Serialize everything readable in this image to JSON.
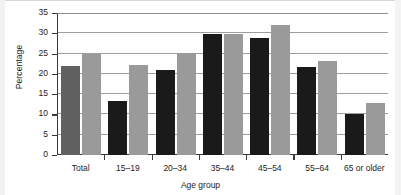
{
  "chart_data": {
    "type": "bar",
    "title": "",
    "xlabel": "Age group",
    "ylabel": "Percentage",
    "categories": [
      "Total",
      "15–19",
      "20–34",
      "35–44",
      "45–54",
      "55–64",
      "65 or older"
    ],
    "series": [
      {
        "name": "series-a",
        "color": "#1a1a1a",
        "values": [
          21.9,
          13.4,
          20.9,
          29.8,
          28.8,
          21.6,
          10.1
        ]
      },
      {
        "name": "series-b",
        "color": "#9a9a9a",
        "values": [
          25.0,
          22.1,
          25.2,
          29.9,
          32.1,
          23.2,
          12.9
        ]
      }
    ],
    "series_a_total_color": "#616161",
    "ylim": [
      0,
      35
    ],
    "yticks": [
      0,
      5,
      10,
      15,
      20,
      25,
      30,
      35
    ],
    "ytick_labels": [
      "0",
      "5",
      "10",
      "15",
      "20",
      "25",
      "30",
      "35"
    ],
    "grid": true,
    "grid_axis": "y",
    "legend": "none",
    "legend_position": "none",
    "axis_line_color": "#3a3a3a",
    "gridline_color": "#9e9e9e",
    "background_color": "#ffffff"
  }
}
